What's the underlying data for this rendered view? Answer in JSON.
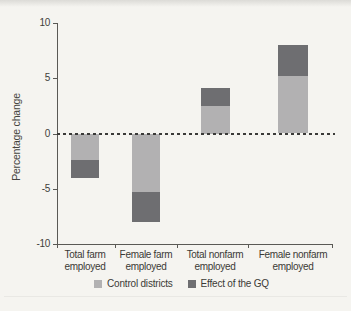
{
  "figure": {
    "background": "#f5f4f0"
  },
  "chart_data": {
    "type": "bar",
    "stacked": true,
    "title": "",
    "xlabel": "",
    "ylabel": "Percentage change",
    "ylim": [
      -10,
      10
    ],
    "yticks": [
      10,
      5,
      0,
      -5,
      -10
    ],
    "ytick_labels": [
      "10",
      "5",
      "0",
      "-5",
      "-10"
    ],
    "zero_line_style": "dashed",
    "grid": false,
    "legend_position": "bottom",
    "categories": [
      "Total farm employed",
      "Female farm employed",
      "Total nonfarm employed",
      "Female nonfarm employed"
    ],
    "category_display_lines": [
      [
        "Total farm",
        "employed"
      ],
      [
        "Female farm",
        "employed"
      ],
      [
        "Total nonfarm",
        "employed"
      ],
      [
        "Female nonfarm",
        "employed"
      ]
    ],
    "series": [
      {
        "name": "Control districts",
        "color": "#b2b1b2",
        "values": [
          -2.4,
          -5.3,
          2.5,
          5.2
        ]
      },
      {
        "name": "Effect of the GQ",
        "color": "#6e6e71",
        "values": [
          -1.6,
          -2.7,
          1.6,
          2.8
        ]
      }
    ],
    "stack_totals": [
      -4.0,
      -8.0,
      4.1,
      8.0
    ]
  },
  "colors": {
    "axis": "#5a5955",
    "text": "#3b3a36",
    "zero_line": "#3a3a38",
    "background": "#f5f4f0"
  }
}
